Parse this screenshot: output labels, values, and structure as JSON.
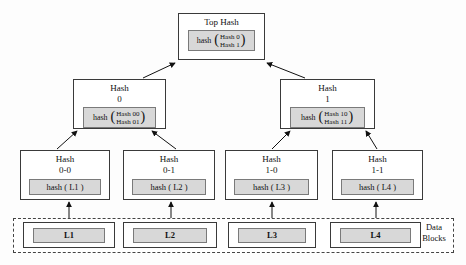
{
  "colors": {
    "hash_fill": "#d8d8d8",
    "box_border": "#3a3a3a",
    "inner_border": "#7a7a7a",
    "edge": "#111111",
    "background": "#fdfdfd"
  },
  "tree": {
    "top": {
      "title": "Top Hash",
      "fn": "hash",
      "open": "(",
      "close": ")",
      "args": [
        "Hash 0",
        "Hash 1"
      ]
    },
    "n0": {
      "title": "Hash",
      "subtitle": "0",
      "fn": "hash",
      "open": "(",
      "close": ")",
      "args": [
        "Hash 00",
        "Hash 01"
      ]
    },
    "n1": {
      "title": "Hash",
      "subtitle": "1",
      "fn": "hash",
      "open": "(",
      "close": ")",
      "args": [
        "Hash 10",
        "Hash 11"
      ]
    },
    "n00": {
      "title": "Hash",
      "subtitle": "0-0",
      "label": "hash ( L1 )"
    },
    "n01": {
      "title": "Hash",
      "subtitle": "0-1",
      "label": "hash ( L2 )"
    },
    "n10": {
      "title": "Hash",
      "subtitle": "1-0",
      "label": "hash ( L3 )"
    },
    "n11": {
      "title": "Hash",
      "subtitle": "1-1",
      "label": "hash ( L4 )"
    }
  },
  "data_blocks": {
    "label": [
      "Data",
      "Blocks"
    ],
    "items": [
      "L1",
      "L2",
      "L3",
      "L4"
    ]
  }
}
